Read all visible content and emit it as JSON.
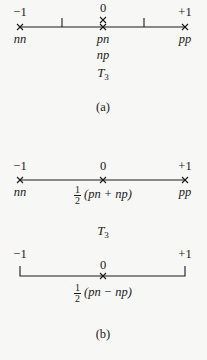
{
  "diagram_a": {
    "axis_labels": {
      "left": "−1",
      "center": "0",
      "right": "+1"
    },
    "particle_labels": {
      "left": "nn",
      "center_top": "pn",
      "center_bottom": "np",
      "right": "pp"
    },
    "operator": {
      "base": "T",
      "sub": "3"
    },
    "caption": "(a)"
  },
  "diagram_b": {
    "top": {
      "axis_labels": {
        "left": "−1",
        "center": "0",
        "right": "+1"
      },
      "particle_labels": {
        "left": "nn",
        "right": "pp"
      },
      "center_state": {
        "num": "1",
        "den": "2",
        "expr": "(pn + np)"
      },
      "operator": {
        "base": "T",
        "sub": "3"
      }
    },
    "bottom": {
      "axis_labels": {
        "left": "−1",
        "center": "0",
        "right": "+1"
      },
      "center_state": {
        "num": "1",
        "den": "2",
        "expr": "(pn − np)"
      }
    },
    "caption": "(b)"
  },
  "colors": {
    "ink": "#1a1a1a",
    "background": "#f7f7f5"
  }
}
